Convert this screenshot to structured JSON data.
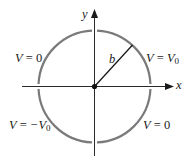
{
  "diagram": {
    "type": "circle-boundary-potential",
    "colors": {
      "circle": "#7a7a7a",
      "axes": "#2a2a2a",
      "radius": "#1a1a1a",
      "text": "#1a1a1a",
      "background": "#ffffff"
    },
    "axes": {
      "x_label": "x",
      "y_label": "y"
    },
    "radius_label": "b",
    "quadrant_labels": {
      "upper_left": {
        "var": "V",
        "eq": " = ",
        "value": "0",
        "sub": ""
      },
      "upper_right": {
        "var": "V",
        "eq": " = ",
        "value": "V",
        "sub": "0"
      },
      "lower_left": {
        "var": "V",
        "eq": " = ",
        "value": "−V",
        "sub": "0"
      },
      "lower_right": {
        "var": "V",
        "eq": " = ",
        "value": "0",
        "sub": ""
      }
    }
  }
}
